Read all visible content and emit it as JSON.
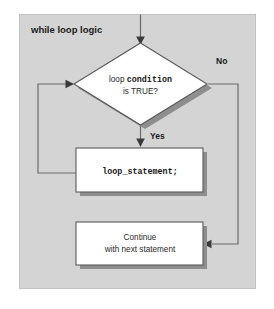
{
  "diagram": {
    "title": "while loop logic",
    "background_color": "#d4d4d4",
    "node_fill_color": "#ffffff",
    "node_border_color": "#5a5a5a",
    "shadow_color": "#8e8e8e",
    "connector_color": "#6b6b6b",
    "arrow_color": "#3a3a3a"
  },
  "nodes": {
    "decision": {
      "shape": "diamond",
      "line1_prefix": "loop ",
      "line1_emphasis": "condition",
      "line2": "is TRUE?"
    },
    "statement": {
      "shape": "process",
      "text": "loop_statement;"
    },
    "continue": {
      "shape": "process",
      "line1": "Continue",
      "line2": "with next statement"
    }
  },
  "edges": {
    "entry": {
      "label": ""
    },
    "true_branch": {
      "label": "Yes"
    },
    "false_branch": {
      "label": "No"
    },
    "loop_back": {
      "label": ""
    }
  }
}
